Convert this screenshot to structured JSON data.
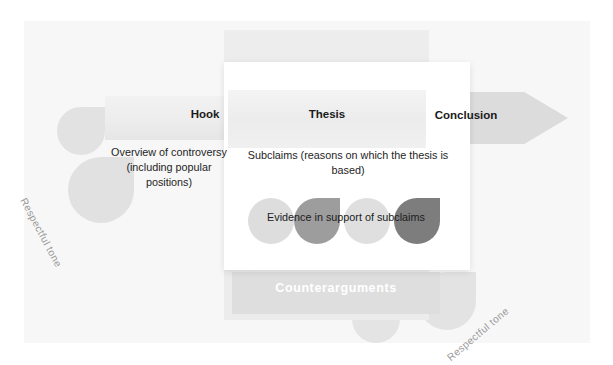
{
  "diagram": {
    "title_elements": {
      "hook": "Hook",
      "thesis": "Thesis",
      "conclusion": "Conclusion",
      "counterarguments": "Counterarguments"
    },
    "descriptions": {
      "hook_desc": "Overview of controversy (including popular positions)",
      "thesis_desc": "Subclaims (reasons on which the thesis is based)",
      "evidence_desc": "Evidence in support of subclaims"
    },
    "tone_labels": {
      "left": "Respectful tone",
      "right": "Respectful tone"
    },
    "shapes": {
      "evidence_circles": [
        {
          "name": "evidence-circle-1",
          "shade": "#dddddd"
        },
        {
          "name": "evidence-circle-2",
          "shade": "#9d9d9d"
        },
        {
          "name": "evidence-circle-3",
          "shade": "#dfdfdf"
        },
        {
          "name": "evidence-circle-4",
          "shade": "#7d7d7d"
        }
      ],
      "background_circles": [
        {
          "name": "circle-upper-left",
          "shade": "#e2e2e2"
        },
        {
          "name": "circle-mid-left",
          "shade": "#e1e1e1"
        },
        {
          "name": "circle-lower-center",
          "shade": "#e4e4e4"
        },
        {
          "name": "circle-lower-right",
          "shade": "#e3e3e3"
        }
      ]
    },
    "colors": {
      "panel_background": "#f7f7f7",
      "band_gray": "#dedede",
      "arrow_gray": "#dcdcdc",
      "card_white": "#ffffff",
      "text_dark": "#1a1a1a",
      "text_muted": "#9a9a9a"
    }
  }
}
